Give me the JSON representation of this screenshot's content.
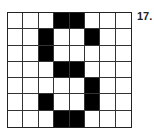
{
  "label": "17.",
  "grid": {
    "columns": 8,
    "rows": 7,
    "filled_color": "#000000",
    "empty_color": "#ffffff",
    "cells": [
      [
        0,
        0,
        0,
        1,
        1,
        0,
        0,
        0
      ],
      [
        0,
        0,
        1,
        0,
        0,
        1,
        0,
        0
      ],
      [
        0,
        0,
        1,
        0,
        0,
        0,
        0,
        0
      ],
      [
        0,
        0,
        0,
        1,
        1,
        0,
        0,
        0
      ],
      [
        0,
        0,
        0,
        0,
        0,
        1,
        0,
        0
      ],
      [
        0,
        0,
        1,
        0,
        0,
        1,
        0,
        0
      ],
      [
        0,
        0,
        0,
        1,
        1,
        0,
        0,
        0
      ]
    ]
  }
}
